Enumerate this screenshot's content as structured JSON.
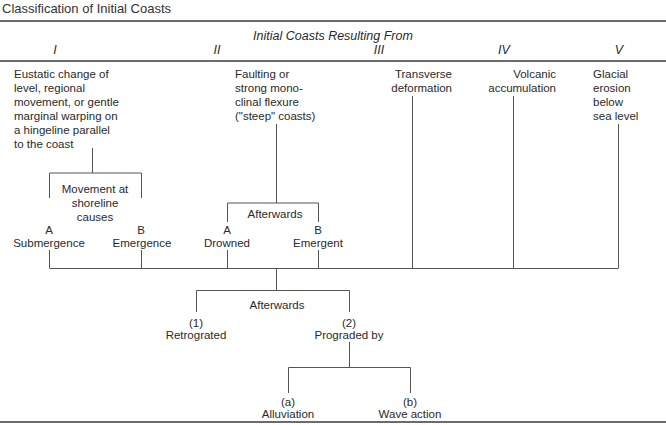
{
  "title": "Classification of Initial Coasts",
  "header": {
    "caption": "Initial Coasts Resulting From",
    "columns": [
      "I",
      "II",
      "III",
      "IV",
      "V"
    ]
  },
  "origins": {
    "I": "Eustatic change of\nlevel, regional\nmovement, or gentle\nmarginal warping on\na hingeline parallel\nto the coast",
    "II": "Faulting or\nstrong mono-\nclinal flexure\n(\"steep\" coasts)",
    "III": "Transverse\ndeformation",
    "IV": "Volcanic\naccumulation",
    "V": "Glacial\nerosion\nbelow\nsea level"
  },
  "branch_I": {
    "caption": "Movement at\nshoreline\ncauses",
    "a_letter": "A",
    "a_label": "Submergence",
    "b_letter": "B",
    "b_label": "Emergence"
  },
  "branch_II": {
    "caption": "Afterwards",
    "a_letter": "A",
    "a_label": "Drowned",
    "b_letter": "B",
    "b_label": "Emergent"
  },
  "afterwards": {
    "caption": "Afterwards",
    "one_num": "(1)",
    "one_label": "Retrograted",
    "two_num": "(2)",
    "two_label": "Prograded by"
  },
  "prograded": {
    "a_num": "(a)",
    "a_label": "Alluviation",
    "b_num": "(b)",
    "b_label": "Wave action"
  },
  "colors": {
    "rule": "#3a3a3a",
    "line": "#555555",
    "text": "#2a2a2a"
  }
}
